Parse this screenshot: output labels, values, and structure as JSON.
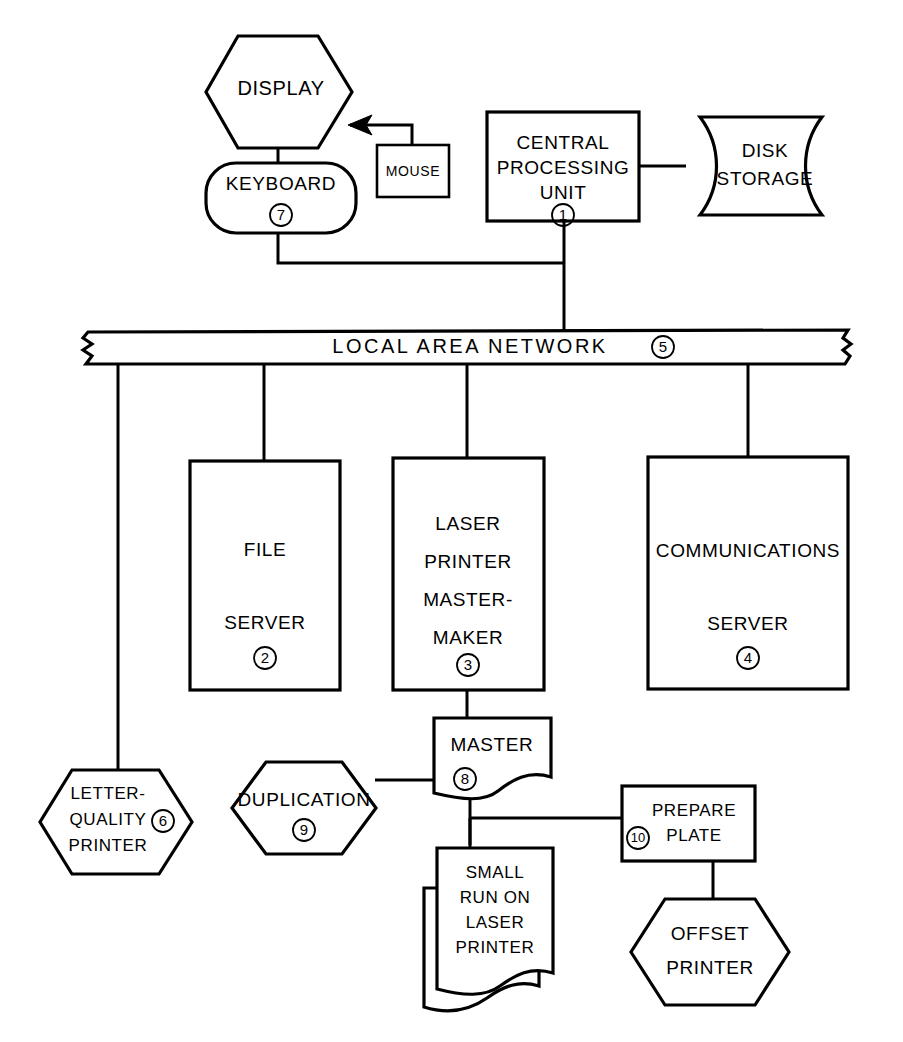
{
  "diagram": {
    "type": "block-flow-diagram",
    "ink_color": "#000000",
    "background_color": "#ffffff",
    "nodes": [
      {
        "id": "display",
        "ref": "",
        "shape": "hexagon",
        "lines": [
          "DISPLAY"
        ]
      },
      {
        "id": "mouse",
        "ref": "",
        "shape": "rectangle",
        "lines": [
          "MOUSE"
        ]
      },
      {
        "id": "keyboard",
        "ref": "7",
        "shape": "rounded-rectangle",
        "lines": [
          "KEYBOARD"
        ]
      },
      {
        "id": "cpu",
        "ref": "1",
        "shape": "rectangle",
        "lines": [
          "CENTRAL",
          "PROCESSING",
          "UNIT"
        ]
      },
      {
        "id": "disk-storage",
        "ref": "",
        "shape": "stored-data",
        "lines": [
          "DISK",
          "STORAGE"
        ]
      },
      {
        "id": "lan",
        "ref": "5",
        "shape": "torn-bar",
        "lines": [
          "LOCAL   AREA   NETWORK"
        ]
      },
      {
        "id": "file-server",
        "ref": "2",
        "shape": "rectangle",
        "lines": [
          "FILE",
          "SERVER"
        ]
      },
      {
        "id": "laser-printer-mastermaker",
        "ref": "3",
        "shape": "rectangle",
        "lines": [
          "LASER",
          "PRINTER",
          "MASTER-",
          "MAKER"
        ]
      },
      {
        "id": "communications-server",
        "ref": "4",
        "shape": "rectangle",
        "lines": [
          "COMMUNICATIONS",
          "SERVER"
        ]
      },
      {
        "id": "letter-quality-printer",
        "ref": "6",
        "shape": "hexagon",
        "lines": [
          "LETTER-",
          "QUALITY",
          "PRINTER"
        ]
      },
      {
        "id": "duplication",
        "ref": "9",
        "shape": "hexagon",
        "lines": [
          "DUPLICATION"
        ]
      },
      {
        "id": "master",
        "ref": "8",
        "shape": "document",
        "lines": [
          "MASTER"
        ]
      },
      {
        "id": "small-run-on-laser-printer",
        "ref": "",
        "shape": "multi-document",
        "lines": [
          "SMALL",
          "RUN ON",
          "LASER",
          "PRINTER"
        ]
      },
      {
        "id": "prepare-plate",
        "ref": "10",
        "shape": "rectangle",
        "lines": [
          "PREPARE",
          "PLATE"
        ]
      },
      {
        "id": "offset-printer",
        "ref": "",
        "shape": "hexagon",
        "lines": [
          "OFFSET",
          "PRINTER"
        ]
      }
    ]
  },
  "labels": {
    "display": "DISPLAY",
    "mouse": "MOUSE",
    "keyboard": "KEYBOARD",
    "cpu_line1": "CENTRAL",
    "cpu_line2": "PROCESSING",
    "cpu_line3": "UNIT",
    "disk_line1": "DISK",
    "disk_line2": "STORAGE",
    "lan": "LOCAL   AREA   NETWORK",
    "file_line1": "FILE",
    "file_line2": "SERVER",
    "laser_line1": "LASER",
    "laser_line2": "PRINTER",
    "laser_line3": "MASTER-",
    "laser_line4": "MAKER",
    "comm_line1": "COMMUNICATIONS",
    "comm_line2": "SERVER",
    "lqp_line1": "LETTER-",
    "lqp_line2": "QUALITY",
    "lqp_line3": "PRINTER",
    "duplication": "DUPLICATION",
    "master": "MASTER",
    "smallrun_line1": "SMALL",
    "smallrun_line2": "RUN ON",
    "smallrun_line3": "LASER",
    "smallrun_line4": "PRINTER",
    "prepare_line1": "PREPARE",
    "prepare_line2": "PLATE",
    "offset_line1": "OFFSET",
    "offset_line2": "PRINTER"
  },
  "refs": {
    "cpu": "1",
    "file_server": "2",
    "laser_mastermaker": "3",
    "comm_server": "4",
    "lan": "5",
    "letter_quality_printer": "6",
    "keyboard": "7",
    "master": "8",
    "duplication": "9",
    "prepare_plate": "10"
  }
}
